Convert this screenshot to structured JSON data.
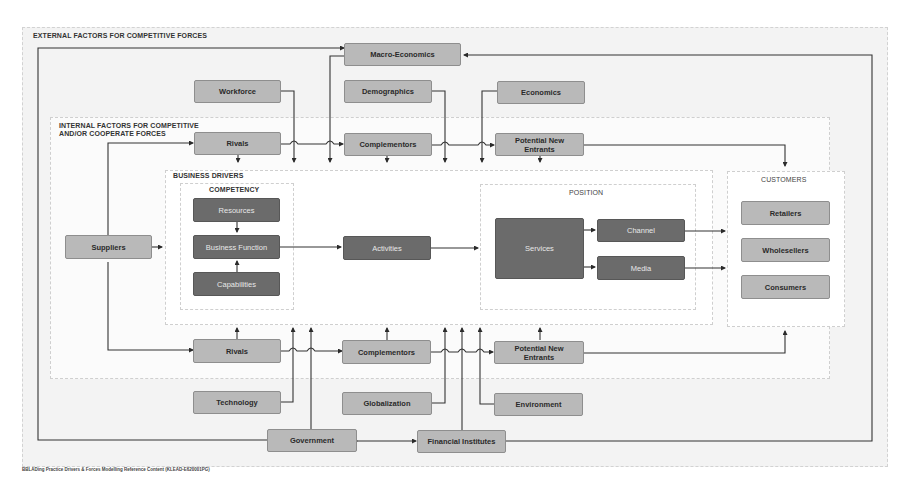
{
  "regions": {
    "external": "EXTERNAL FACTORS FOR COMPETITIVE FORCES",
    "internal": "INTERNAL FACTORS FOR COMPETITIVE\nAND/OR COOPERATE FORCES",
    "business_drivers": "BUSINESS DRIVERS",
    "competency": "COMPETENCY",
    "position": "POSITION",
    "customers": "CUSTOMERS"
  },
  "external_factors": {
    "macro_economics": "Macro-Economics",
    "workforce": "Workforce",
    "demographics": "Demographics",
    "economics": "Economics",
    "technology": "Technology",
    "globalization": "Globalization",
    "environment": "Environment",
    "government": "Government",
    "financial_institutes": "Financial Institutes"
  },
  "internal_factors": {
    "rivals_top": "Rivals",
    "complementors_top": "Complementors",
    "potential_new_entrants_top": "Potential New Entrants",
    "rivals_bottom": "Rivals",
    "complementors_bottom": "Complementors",
    "potential_new_entrants_bottom": "Potential New Entrants",
    "suppliers": "Suppliers"
  },
  "competency": {
    "resources": "Resources",
    "business_function": "Business Function",
    "capabilities": "Capabilities"
  },
  "activities": "Activities",
  "position": {
    "services": "Services",
    "channel": "Channel",
    "media": "Media"
  },
  "customers": {
    "retailers": "Retailers",
    "wholesellers": "Wholesellers",
    "consumers": "Consumers"
  },
  "footer": "BBLADing Practice Drivers & Forces Modelling Reference Content (KLEAD-E620001PG)",
  "colors": {
    "light_box": "#b9b9b9",
    "dark_box": "#6b6b6b",
    "line": "#333333",
    "outer_bg": "#f3f3f3"
  }
}
